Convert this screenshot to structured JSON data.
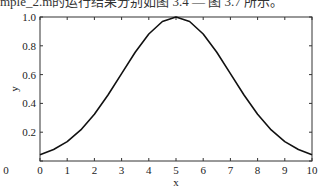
{
  "caption": "mple_2.m的运行结果分别如图 3.4 — 图 3.7 所示。",
  "chart_data": {
    "type": "line",
    "title": "",
    "xlabel": "x",
    "ylabel": "y",
    "xlim": [
      0,
      10
    ],
    "ylim": [
      0,
      1.0
    ],
    "grid": false,
    "legend": null,
    "xticks": [
      "0",
      "1",
      "2",
      "3",
      "4",
      "5",
      "6",
      "7",
      "8",
      "9",
      "10"
    ],
    "yticks": [
      "0",
      "0.2",
      "0.4",
      "0.6",
      "0.8",
      "1.0"
    ],
    "series": [
      {
        "name": "y",
        "x": [
          0,
          0.5,
          1,
          1.5,
          2,
          2.5,
          3,
          3.5,
          4,
          4.5,
          5,
          5.5,
          6,
          6.5,
          7,
          7.5,
          8,
          8.5,
          9,
          9.5,
          10
        ],
        "values": [
          0.044,
          0.08,
          0.135,
          0.216,
          0.325,
          0.458,
          0.607,
          0.755,
          0.882,
          0.969,
          1.0,
          0.969,
          0.882,
          0.755,
          0.607,
          0.458,
          0.325,
          0.216,
          0.135,
          0.08,
          0.044
        ]
      }
    ]
  }
}
